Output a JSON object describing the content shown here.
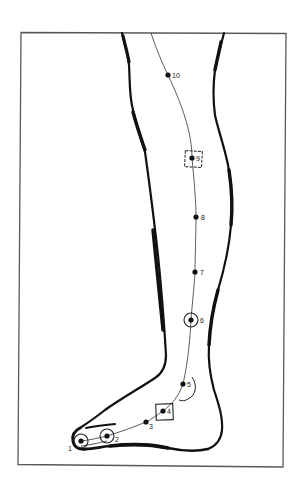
{
  "diagram": {
    "colors": {
      "background": "#ffffff",
      "frame": "#5a5a5a",
      "outline": "#111111",
      "meridian": "#333333",
      "points": "#111111"
    },
    "frame": {
      "x": 20,
      "y": 32,
      "width": 265,
      "height": 434
    },
    "points": [
      {
        "id": "1",
        "label": "1",
        "x": 81,
        "y": 441,
        "marker": "circle",
        "label_dx": -13,
        "label_dy": 10
      },
      {
        "id": "2",
        "label": "2",
        "x": 107,
        "y": 436,
        "marker": "circle",
        "label_dx": 8,
        "label_dy": 6
      },
      {
        "id": "3",
        "label": "3",
        "x": 146,
        "y": 422,
        "marker": "none",
        "label_dx": 3,
        "label_dy": 7
      },
      {
        "id": "4",
        "label": "4",
        "x": 163,
        "y": 411,
        "marker": "square",
        "label_dx": 4,
        "label_dy": 3
      },
      {
        "id": "5",
        "label": "5",
        "x": 183,
        "y": 384,
        "marker": "none",
        "label_dx": 4,
        "label_dy": 3
      },
      {
        "id": "6",
        "label": "6",
        "x": 191,
        "y": 320,
        "marker": "circle",
        "label_dx": 9,
        "label_dy": 3
      },
      {
        "id": "7",
        "label": "7",
        "x": 195,
        "y": 272,
        "marker": "none",
        "label_dx": 5,
        "label_dy": 3
      },
      {
        "id": "8",
        "label": "8",
        "x": 196,
        "y": 217,
        "marker": "none",
        "label_dx": 5,
        "label_dy": 3
      },
      {
        "id": "9",
        "label": "9",
        "x": 192,
        "y": 158,
        "marker": "square-dashed",
        "label_dx": 4,
        "label_dy": 3
      },
      {
        "id": "10",
        "label": "10",
        "x": 168,
        "y": 75,
        "marker": "none",
        "label_dx": 4,
        "label_dy": 3
      }
    ]
  }
}
